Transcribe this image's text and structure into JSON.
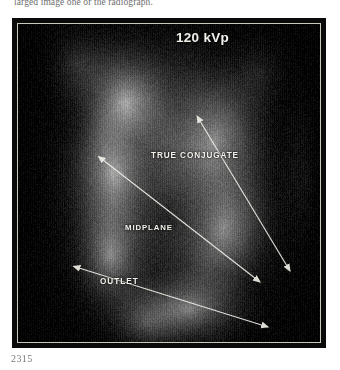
{
  "caption": {
    "top_text": "larged image one or the radiograph.",
    "figure_number": "2315"
  },
  "radiograph": {
    "alt_description": "lateral pelvimetry radiograph",
    "technique_label": "120 kVp",
    "annotations": [
      {
        "id": "true-conjugate",
        "label": "TRUE CONJUGATE"
      },
      {
        "id": "midplane",
        "label": "MIDPLANE"
      },
      {
        "id": "outlet",
        "label": "OUTLET"
      }
    ],
    "measurement_lines": [
      {
        "id": "true-conjugate-line",
        "label": "TRUE CONJUGATE",
        "x1": 182,
        "y1": 97,
        "x2": 272,
        "y2": 247,
        "arrow_start": true,
        "arrow_end": true
      },
      {
        "id": "midplane-line",
        "label": "MIDPLANE",
        "x1": 85,
        "y1": 136,
        "x2": 242,
        "y2": 258,
        "arrow_start": true,
        "arrow_end": true
      },
      {
        "id": "outlet-line",
        "label": "OUTLET",
        "x1": 61,
        "y1": 244,
        "x2": 250,
        "y2": 303,
        "arrow_start": true,
        "arrow_end": true
      }
    ],
    "colors": {
      "annotation_stroke": "#f0eee7",
      "frame_border": "#0a0a0a",
      "inner_rule": "#c9c6bd",
      "caption_text": "#6d6d6d"
    }
  }
}
